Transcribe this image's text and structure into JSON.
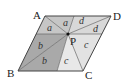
{
  "diagram": {
    "vertices": {
      "A": {
        "label": "A",
        "x": 45,
        "y": 16
      },
      "B": {
        "label": "B",
        "x": 18,
        "y": 71
      },
      "C": {
        "label": "C",
        "x": 83,
        "y": 71
      },
      "D": {
        "label": "D",
        "x": 111,
        "y": 16
      }
    },
    "point": {
      "label": "P",
      "x": 68,
      "y": 34
    },
    "aux_points": {
      "T": {
        "x": 74,
        "y": 16
      },
      "M": {
        "x": 57,
        "y": 71
      },
      "L": {
        "x": 36,
        "y": 34
      },
      "R": {
        "x": 102,
        "y": 34
      }
    },
    "regions": [
      {
        "id": "a-top",
        "label": "a",
        "color": "#c6c6c6"
      },
      {
        "id": "a-left",
        "label": "a",
        "color": "#c6c6c6"
      },
      {
        "id": "d-top",
        "label": "d",
        "color": "#d8d8d8"
      },
      {
        "id": "d-right",
        "label": "d",
        "color": "#d8d8d8"
      },
      {
        "id": "b-upper",
        "label": "b",
        "color": "#a9a9a9"
      },
      {
        "id": "b-lower",
        "label": "b",
        "color": "#a9a9a9"
      },
      {
        "id": "c-lower",
        "label": "c",
        "color": "#e8e8e8"
      },
      {
        "id": "c-right",
        "label": "c",
        "color": "#e2e2e2"
      }
    ],
    "labels": {
      "A": "A",
      "B": "B",
      "C": "C",
      "D": "D",
      "P": "P",
      "a": "a",
      "b": "b",
      "c": "c",
      "d": "d"
    },
    "stroke_color": "#555555"
  }
}
